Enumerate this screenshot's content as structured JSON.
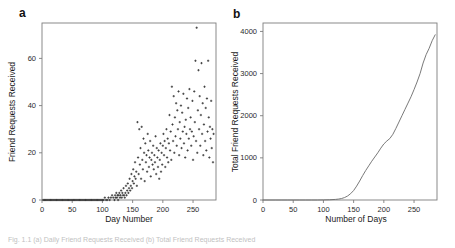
{
  "figure": {
    "caption": "Fig. 1.1 (a) Daily Friend Requests Received (b) Total Friend Requests Received"
  },
  "panels": {
    "a": {
      "letter": "a",
      "xlabel": "Day Number",
      "ylabel": "Friend Requests Received",
      "xticks": [
        "0",
        "50",
        "100",
        "150",
        "200",
        "250"
      ],
      "yticks": [
        "0",
        "20",
        "40",
        "60"
      ]
    },
    "b": {
      "letter": "b",
      "xlabel": "Number of Days",
      "ylabel": "Total Friend Requests Received",
      "xticks": [
        "0",
        "50",
        "100",
        "150",
        "200",
        "250"
      ],
      "yticks": [
        "0",
        "1000",
        "2000",
        "3000",
        "4000"
      ]
    }
  },
  "colors": {
    "marker": "#2b2b2b",
    "line": "#6a6a6a",
    "frame": "#7d7d7d",
    "text": "#1a1a1a",
    "background": "#ffffff"
  },
  "chart_data": [
    {
      "type": "scatter",
      "title": "",
      "xlabel": "Day Number",
      "ylabel": "Friend Requests Received",
      "xlim": [
        0,
        288
      ],
      "ylim": [
        0,
        75
      ],
      "xticks": [
        0,
        50,
        100,
        150,
        200,
        250
      ],
      "yticks": [
        0,
        20,
        40,
        60
      ],
      "grid": false,
      "legend": null,
      "marker": "plus",
      "points": [
        [
          2,
          0
        ],
        [
          4,
          0
        ],
        [
          6,
          0
        ],
        [
          8,
          0
        ],
        [
          10,
          0
        ],
        [
          12,
          0
        ],
        [
          14,
          0
        ],
        [
          16,
          0
        ],
        [
          18,
          0
        ],
        [
          20,
          0
        ],
        [
          22,
          0
        ],
        [
          24,
          0
        ],
        [
          26,
          0
        ],
        [
          28,
          0
        ],
        [
          30,
          0
        ],
        [
          32,
          0
        ],
        [
          34,
          0
        ],
        [
          36,
          0
        ],
        [
          38,
          0
        ],
        [
          40,
          0
        ],
        [
          42,
          0
        ],
        [
          44,
          0
        ],
        [
          46,
          0
        ],
        [
          48,
          0
        ],
        [
          50,
          0
        ],
        [
          52,
          0
        ],
        [
          54,
          0
        ],
        [
          56,
          0
        ],
        [
          58,
          0
        ],
        [
          60,
          0
        ],
        [
          62,
          0
        ],
        [
          64,
          0
        ],
        [
          66,
          0
        ],
        [
          68,
          0
        ],
        [
          70,
          0
        ],
        [
          72,
          0
        ],
        [
          74,
          0
        ],
        [
          76,
          0
        ],
        [
          78,
          0
        ],
        [
          80,
          0
        ],
        [
          82,
          0
        ],
        [
          84,
          0
        ],
        [
          86,
          0
        ],
        [
          88,
          0
        ],
        [
          90,
          0
        ],
        [
          92,
          0
        ],
        [
          94,
          0
        ],
        [
          96,
          0
        ],
        [
          98,
          0
        ],
        [
          100,
          0
        ],
        [
          102,
          0
        ],
        [
          104,
          1
        ],
        [
          106,
          0
        ],
        [
          108,
          0
        ],
        [
          110,
          1
        ],
        [
          112,
          0
        ],
        [
          114,
          1
        ],
        [
          116,
          2
        ],
        [
          118,
          1
        ],
        [
          120,
          0
        ],
        [
          121,
          2
        ],
        [
          122,
          1
        ],
        [
          123,
          3
        ],
        [
          124,
          1
        ],
        [
          125,
          2
        ],
        [
          126,
          0
        ],
        [
          127,
          2
        ],
        [
          128,
          3
        ],
        [
          129,
          1
        ],
        [
          130,
          2
        ],
        [
          131,
          4
        ],
        [
          132,
          1
        ],
        [
          133,
          3
        ],
        [
          134,
          2
        ],
        [
          135,
          5
        ],
        [
          136,
          2
        ],
        [
          137,
          1
        ],
        [
          138,
          3
        ],
        [
          139,
          6
        ],
        [
          140,
          2
        ],
        [
          141,
          4
        ],
        [
          142,
          7
        ],
        [
          143,
          3
        ],
        [
          144,
          5
        ],
        [
          145,
          9
        ],
        [
          146,
          4
        ],
        [
          147,
          6
        ],
        [
          148,
          11
        ],
        [
          149,
          5
        ],
        [
          150,
          8
        ],
        [
          151,
          13
        ],
        [
          152,
          7
        ],
        [
          153,
          10
        ],
        [
          154,
          16
        ],
        [
          155,
          9
        ],
        [
          156,
          12
        ],
        [
          157,
          6
        ],
        [
          158,
          33
        ],
        [
          159,
          18
        ],
        [
          160,
          11
        ],
        [
          161,
          30
        ],
        [
          162,
          15
        ],
        [
          163,
          22
        ],
        [
          164,
          9
        ],
        [
          165,
          31
        ],
        [
          166,
          17
        ],
        [
          167,
          13
        ],
        [
          168,
          26
        ],
        [
          169,
          20
        ],
        [
          170,
          8
        ],
        [
          171,
          24
        ],
        [
          172,
          16
        ],
        [
          173,
          19
        ],
        [
          174,
          12
        ],
        [
          175,
          28
        ],
        [
          176,
          21
        ],
        [
          177,
          14
        ],
        [
          178,
          18
        ],
        [
          179,
          25
        ],
        [
          180,
          10
        ],
        [
          181,
          17
        ],
        [
          182,
          20
        ],
        [
          183,
          15
        ],
        [
          184,
          23
        ],
        [
          185,
          13
        ],
        [
          186,
          19
        ],
        [
          187,
          16
        ],
        [
          188,
          27
        ],
        [
          189,
          11
        ],
        [
          190,
          22
        ],
        [
          191,
          18
        ],
        [
          192,
          14
        ],
        [
          193,
          21
        ],
        [
          194,
          9
        ],
        [
          195,
          17
        ],
        [
          196,
          24
        ],
        [
          197,
          12
        ],
        [
          198,
          20
        ],
        [
          199,
          15
        ],
        [
          200,
          23
        ],
        [
          201,
          28
        ],
        [
          202,
          19
        ],
        [
          203,
          25
        ],
        [
          204,
          14
        ],
        [
          205,
          22
        ],
        [
          206,
          30
        ],
        [
          207,
          18
        ],
        [
          208,
          26
        ],
        [
          209,
          16
        ],
        [
          210,
          24
        ],
        [
          211,
          36
        ],
        [
          212,
          21
        ],
        [
          213,
          29
        ],
        [
          214,
          17
        ],
        [
          215,
          48
        ],
        [
          216,
          32
        ],
        [
          217,
          25
        ],
        [
          218,
          44
        ],
        [
          219,
          20
        ],
        [
          220,
          35
        ],
        [
          221,
          27
        ],
        [
          222,
          41
        ],
        [
          223,
          23
        ],
        [
          224,
          38
        ],
        [
          225,
          30
        ],
        [
          226,
          46
        ],
        [
          227,
          19
        ],
        [
          228,
          33
        ],
        [
          229,
          26
        ],
        [
          230,
          40
        ],
        [
          231,
          22
        ],
        [
          232,
          37
        ],
        [
          233,
          29
        ],
        [
          234,
          45
        ],
        [
          235,
          24
        ],
        [
          236,
          31
        ],
        [
          237,
          18
        ],
        [
          238,
          34
        ],
        [
          239,
          28
        ],
        [
          240,
          43
        ],
        [
          241,
          21
        ],
        [
          242,
          39
        ],
        [
          243,
          26
        ],
        [
          244,
          47
        ],
        [
          245,
          30
        ],
        [
          246,
          35
        ],
        [
          247,
          23
        ],
        [
          248,
          29
        ],
        [
          249,
          42
        ],
        [
          250,
          17
        ],
        [
          251,
          27
        ],
        [
          252,
          46
        ],
        [
          253,
          33
        ],
        [
          254,
          59
        ],
        [
          255,
          25
        ],
        [
          256,
          73
        ],
        [
          257,
          20
        ],
        [
          258,
          38
        ],
        [
          259,
          55
        ],
        [
          260,
          30
        ],
        [
          261,
          44
        ],
        [
          262,
          23
        ],
        [
          263,
          36
        ],
        [
          264,
          58
        ],
        [
          265,
          28
        ],
        [
          266,
          41
        ],
        [
          267,
          19
        ],
        [
          268,
          32
        ],
        [
          269,
          48
        ],
        [
          270,
          25
        ],
        [
          271,
          39
        ],
        [
          272,
          21
        ],
        [
          273,
          43
        ],
        [
          274,
          29
        ],
        [
          275,
          59
        ],
        [
          276,
          35
        ],
        [
          277,
          18
        ],
        [
          278,
          31
        ],
        [
          279,
          26
        ],
        [
          280,
          42
        ],
        [
          281,
          22
        ],
        [
          282,
          30
        ],
        [
          283,
          16
        ],
        [
          284,
          28
        ]
      ]
    },
    {
      "type": "line",
      "title": "",
      "xlabel": "Number of Days",
      "ylabel": "Total Friend Requests Received",
      "xlim": [
        0,
        288
      ],
      "ylim": [
        0,
        4200
      ],
      "xticks": [
        0,
        50,
        100,
        150,
        200,
        250
      ],
      "yticks": [
        0,
        1000,
        2000,
        3000,
        4000
      ],
      "grid": false,
      "legend": null,
      "series": [
        {
          "name": "Cumulative Friend Requests",
          "x": [
            0,
            10,
            20,
            30,
            40,
            50,
            60,
            70,
            80,
            90,
            100,
            110,
            120,
            125,
            130,
            135,
            140,
            145,
            150,
            155,
            160,
            165,
            170,
            175,
            180,
            185,
            190,
            195,
            200,
            205,
            210,
            215,
            220,
            225,
            230,
            235,
            240,
            245,
            250,
            255,
            260,
            265,
            270,
            275,
            280,
            285
          ],
          "values": [
            0,
            0,
            0,
            0,
            0,
            0,
            0,
            0,
            0,
            0,
            2,
            6,
            14,
            22,
            35,
            58,
            95,
            150,
            225,
            330,
            450,
            580,
            700,
            810,
            920,
            1020,
            1120,
            1230,
            1330,
            1400,
            1460,
            1560,
            1700,
            1850,
            2000,
            2150,
            2300,
            2450,
            2620,
            2800,
            3000,
            3250,
            3450,
            3600,
            3780,
            3920
          ]
        }
      ]
    }
  ]
}
